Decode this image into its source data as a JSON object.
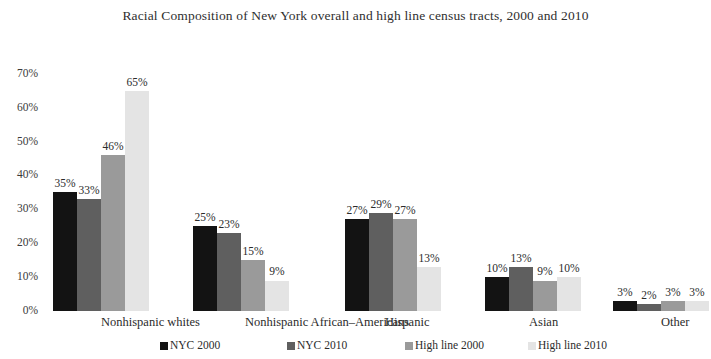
{
  "chart_data": {
    "type": "bar",
    "title": "Racial Composition of New York overall and high line census tracts, 2000 and 2010",
    "xlabel": "",
    "ylabel": "",
    "ylim": [
      0,
      70
    ],
    "grid": false,
    "legend_position": "bottom",
    "y_ticks": [
      "0%",
      "10%",
      "20%",
      "30%",
      "40%",
      "50%",
      "60%",
      "70%"
    ],
    "categories": [
      "Nonhispanic whites",
      "Nonhispanic African–Americans",
      "Hispanic",
      "Asian",
      "Other"
    ],
    "series": [
      {
        "name": "NYC 2000",
        "color": "#131313",
        "values": [
          35,
          25,
          27,
          10,
          3
        ],
        "labels": [
          "35%",
          "25%",
          "27%",
          "10%",
          "3%"
        ]
      },
      {
        "name": "NYC 2010",
        "color": "#5f5f5f",
        "values": [
          33,
          23,
          29,
          13,
          2
        ],
        "labels": [
          "33%",
          "23%",
          "29%",
          "13%",
          "2%"
        ]
      },
      {
        "name": "High line 2000",
        "color": "#9a9a9a",
        "values": [
          46,
          15,
          27,
          9,
          3
        ],
        "labels": [
          "46%",
          "15%",
          "27%",
          "9%",
          "3%"
        ]
      },
      {
        "name": "High line 2010",
        "color": "#e4e4e4",
        "values": [
          65,
          9,
          13,
          10,
          3
        ],
        "labels": [
          "65%",
          "9%",
          "13%",
          "10%",
          "3%"
        ]
      }
    ]
  },
  "layout": {
    "baseline_y": 311,
    "pixels_per_ten_percent": 33.9,
    "bar_width": 24,
    "group_starts": [
      53,
      193,
      345,
      485,
      613
    ],
    "category_centers": [
      101,
      245,
      385,
      529,
      661
    ],
    "legend_x": [
      160,
      287,
      405,
      528
    ]
  }
}
